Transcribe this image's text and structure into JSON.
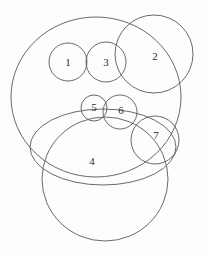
{
  "figure": {
    "kind": "overlapping-circles-diagram",
    "background_color": "#fdfdfc",
    "stroke_color": "#585858",
    "label_color": "#2b2b2b",
    "width": 206,
    "height": 254,
    "labels": {
      "one": "1",
      "two": "2",
      "three": "3",
      "four": "4",
      "five": "5",
      "six": "6",
      "seven": "7"
    },
    "shapes": [
      {
        "id": "big-top-circle",
        "label": "",
        "cx": 96,
        "cy": 97,
        "rx": 85,
        "ry": 80
      },
      {
        "id": "circle-2",
        "label": "2",
        "cx": 154,
        "cy": 54,
        "rx": 39,
        "ry": 39
      },
      {
        "id": "circle-1",
        "label": "1",
        "cx": 68,
        "cy": 62,
        "rx": 19,
        "ry": 19
      },
      {
        "id": "circle-3",
        "label": "3",
        "cx": 106,
        "cy": 62,
        "rx": 20,
        "ry": 20
      },
      {
        "id": "circle-5",
        "label": "5",
        "cx": 94,
        "cy": 108,
        "rx": 13,
        "ry": 13
      },
      {
        "id": "circle-6",
        "label": "6",
        "cx": 120,
        "cy": 112,
        "rx": 17,
        "ry": 17
      },
      {
        "id": "circle-7",
        "label": "7",
        "cx": 155,
        "cy": 140,
        "rx": 24,
        "ry": 24
      },
      {
        "id": "circle-4-ellipse",
        "label": "4",
        "cx": 103,
        "cy": 147,
        "rx": 73,
        "ry": 38
      },
      {
        "id": "bottom-circle",
        "label": "",
        "cx": 105,
        "cy": 179,
        "rx": 63,
        "ry": 62
      }
    ],
    "label_positions": {
      "one": {
        "x": 68,
        "y": 63
      },
      "two": {
        "x": 155,
        "y": 57
      },
      "three": {
        "x": 106,
        "y": 63
      },
      "four": {
        "x": 92,
        "y": 162
      },
      "five": {
        "x": 94,
        "y": 108
      },
      "six": {
        "x": 121,
        "y": 111
      },
      "seven": {
        "x": 156,
        "y": 136
      }
    }
  }
}
